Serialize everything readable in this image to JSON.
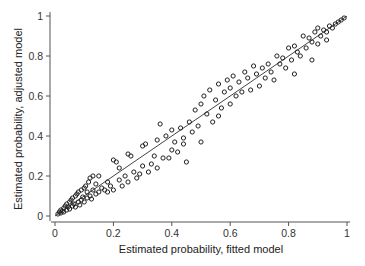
{
  "chart_data": {
    "type": "scatter",
    "title": "",
    "xlabel": "Estimated probability, fitted model",
    "ylabel": "Estimated probability, adjusted model",
    "xlim": [
      0,
      1
    ],
    "ylim": [
      0,
      1
    ],
    "x_ticks": [
      "0",
      "0.2",
      "0.4",
      "0.6",
      "0.8",
      "1"
    ],
    "y_ticks": [
      "0",
      "0.2",
      "0.4",
      "0.6",
      "0.8",
      "1"
    ],
    "grid": false,
    "legend": null,
    "reference_line": {
      "type": "identity",
      "from": [
        0,
        0
      ],
      "to": [
        1,
        1
      ]
    },
    "marker": "open-circle",
    "series": [
      {
        "name": "observations",
        "points": [
          [
            0.01,
            0.01
          ],
          [
            0.015,
            0.02
          ],
          [
            0.02,
            0.015
          ],
          [
            0.02,
            0.03
          ],
          [
            0.025,
            0.025
          ],
          [
            0.03,
            0.04
          ],
          [
            0.03,
            0.02
          ],
          [
            0.035,
            0.05
          ],
          [
            0.04,
            0.03
          ],
          [
            0.04,
            0.06
          ],
          [
            0.045,
            0.045
          ],
          [
            0.05,
            0.07
          ],
          [
            0.05,
            0.035
          ],
          [
            0.055,
            0.08
          ],
          [
            0.06,
            0.05
          ],
          [
            0.06,
            0.09
          ],
          [
            0.065,
            0.06
          ],
          [
            0.07,
            0.1
          ],
          [
            0.07,
            0.045
          ],
          [
            0.075,
            0.11
          ],
          [
            0.08,
            0.07
          ],
          [
            0.08,
            0.12
          ],
          [
            0.085,
            0.055
          ],
          [
            0.09,
            0.13
          ],
          [
            0.09,
            0.08
          ],
          [
            0.095,
            0.095
          ],
          [
            0.1,
            0.14
          ],
          [
            0.1,
            0.07
          ],
          [
            0.105,
            0.15
          ],
          [
            0.11,
            0.09
          ],
          [
            0.11,
            0.12
          ],
          [
            0.115,
            0.17
          ],
          [
            0.12,
            0.1
          ],
          [
            0.12,
            0.19
          ],
          [
            0.125,
            0.085
          ],
          [
            0.13,
            0.13
          ],
          [
            0.13,
            0.2
          ],
          [
            0.14,
            0.11
          ],
          [
            0.14,
            0.16
          ],
          [
            0.15,
            0.12
          ],
          [
            0.15,
            0.2
          ],
          [
            0.16,
            0.14
          ],
          [
            0.17,
            0.13
          ],
          [
            0.18,
            0.12
          ],
          [
            0.18,
            0.17
          ],
          [
            0.19,
            0.15
          ],
          [
            0.2,
            0.28
          ],
          [
            0.2,
            0.13
          ],
          [
            0.21,
            0.27
          ],
          [
            0.22,
            0.18
          ],
          [
            0.22,
            0.24
          ],
          [
            0.23,
            0.15
          ],
          [
            0.24,
            0.2
          ],
          [
            0.25,
            0.17
          ],
          [
            0.25,
            0.31
          ],
          [
            0.26,
            0.3
          ],
          [
            0.27,
            0.22
          ],
          [
            0.28,
            0.19
          ],
          [
            0.29,
            0.21
          ],
          [
            0.3,
            0.35
          ],
          [
            0.3,
            0.25
          ],
          [
            0.31,
            0.36
          ],
          [
            0.32,
            0.22
          ],
          [
            0.33,
            0.26
          ],
          [
            0.34,
            0.3
          ],
          [
            0.35,
            0.38
          ],
          [
            0.35,
            0.24
          ],
          [
            0.36,
            0.46
          ],
          [
            0.37,
            0.29
          ],
          [
            0.38,
            0.4
          ],
          [
            0.39,
            0.29
          ],
          [
            0.4,
            0.33
          ],
          [
            0.4,
            0.43
          ],
          [
            0.41,
            0.37
          ],
          [
            0.42,
            0.32
          ],
          [
            0.43,
            0.44
          ],
          [
            0.44,
            0.36
          ],
          [
            0.44,
            0.39
          ],
          [
            0.45,
            0.27
          ],
          [
            0.46,
            0.47
          ],
          [
            0.47,
            0.42
          ],
          [
            0.48,
            0.53
          ],
          [
            0.49,
            0.45
          ],
          [
            0.5,
            0.37
          ],
          [
            0.5,
            0.56
          ],
          [
            0.51,
            0.6
          ],
          [
            0.52,
            0.51
          ],
          [
            0.53,
            0.63
          ],
          [
            0.54,
            0.47
          ],
          [
            0.55,
            0.58
          ],
          [
            0.56,
            0.5
          ],
          [
            0.56,
            0.66
          ],
          [
            0.57,
            0.54
          ],
          [
            0.58,
            0.62
          ],
          [
            0.59,
            0.68
          ],
          [
            0.6,
            0.56
          ],
          [
            0.6,
            0.64
          ],
          [
            0.61,
            0.7
          ],
          [
            0.62,
            0.6
          ],
          [
            0.63,
            0.67
          ],
          [
            0.64,
            0.62
          ],
          [
            0.65,
            0.72
          ],
          [
            0.66,
            0.69
          ],
          [
            0.67,
            0.63
          ],
          [
            0.68,
            0.75
          ],
          [
            0.69,
            0.71
          ],
          [
            0.7,
            0.65
          ],
          [
            0.71,
            0.74
          ],
          [
            0.72,
            0.69
          ],
          [
            0.73,
            0.76
          ],
          [
            0.74,
            0.72
          ],
          [
            0.75,
            0.68
          ],
          [
            0.76,
            0.8
          ],
          [
            0.77,
            0.76
          ],
          [
            0.78,
            0.79
          ],
          [
            0.79,
            0.74
          ],
          [
            0.8,
            0.84
          ],
          [
            0.81,
            0.78
          ],
          [
            0.82,
            0.85
          ],
          [
            0.82,
            0.71
          ],
          [
            0.83,
            0.82
          ],
          [
            0.84,
            0.8
          ],
          [
            0.85,
            0.9
          ],
          [
            0.86,
            0.84
          ],
          [
            0.87,
            0.89
          ],
          [
            0.88,
            0.87
          ],
          [
            0.89,
            0.92
          ],
          [
            0.9,
            0.86
          ],
          [
            0.9,
            0.94
          ],
          [
            0.91,
            0.9
          ],
          [
            0.92,
            0.93
          ],
          [
            0.93,
            0.92
          ],
          [
            0.94,
            0.95
          ],
          [
            0.95,
            0.94
          ],
          [
            0.96,
            0.96
          ],
          [
            0.97,
            0.97
          ],
          [
            0.98,
            0.98
          ],
          [
            0.99,
            0.99
          ],
          [
            0.93,
            0.88
          ],
          [
            0.88,
            0.78
          ]
        ]
      }
    ]
  }
}
